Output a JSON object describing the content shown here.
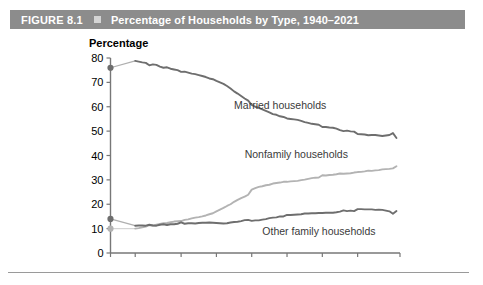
{
  "header": {
    "figure_label": "FIGURE 8.1",
    "bullet_icon": "square-bullet-icon",
    "title": "Percentage of Households by Type, 1940–2021",
    "bar_color": "#8c8c8c",
    "text_color": "#ffffff"
  },
  "chart_data": {
    "type": "line",
    "title": "Percentage of Households by Type, 1940–2021",
    "xlabel": "",
    "ylabel": "Percentage",
    "ylim": [
      0,
      80
    ],
    "xlim": [
      1940,
      2022
    ],
    "ytick_labels": [
      "0",
      "10",
      "20",
      "30",
      "40",
      "50",
      "60",
      "70",
      "80"
    ],
    "yticks": [
      0,
      10,
      20,
      30,
      40,
      50,
      60,
      70,
      80
    ],
    "xtick_labels": [
      "1940",
      "1947",
      "1960",
      "1970",
      "1980",
      "1990",
      "2000",
      "2010",
      "2022"
    ],
    "xticks": [
      1940,
      1947,
      1960,
      1970,
      1980,
      1990,
      2000,
      2010,
      2022
    ],
    "grid": false,
    "legend_position": "inline-annotations",
    "series": [
      {
        "name": "Married households",
        "color": "#6e6e6e",
        "label_x": 1975,
        "label_y": 59,
        "start_marker": {
          "x": 1940,
          "y": 76.0
        },
        "x": [
          1947,
          1948,
          1949,
          1950,
          1951,
          1952,
          1953,
          1954,
          1955,
          1956,
          1957,
          1958,
          1959,
          1960,
          1961,
          1962,
          1963,
          1964,
          1965,
          1966,
          1967,
          1968,
          1969,
          1970,
          1971,
          1972,
          1973,
          1974,
          1975,
          1976,
          1977,
          1978,
          1979,
          1980,
          1981,
          1982,
          1983,
          1984,
          1985,
          1986,
          1987,
          1988,
          1989,
          1990,
          1991,
          1992,
          1993,
          1994,
          1995,
          1996,
          1997,
          1998,
          1999,
          2000,
          2001,
          2002,
          2003,
          2004,
          2005,
          2006,
          2007,
          2008,
          2009,
          2010,
          2011,
          2012,
          2013,
          2014,
          2015,
          2016,
          2017,
          2018,
          2019,
          2020,
          2021
        ],
        "y": [
          78.8,
          78.5,
          78.2,
          78.0,
          77.0,
          77.4,
          77.2,
          76.5,
          76.0,
          76.2,
          75.6,
          75.3,
          75.0,
          74.3,
          74.4,
          74.0,
          73.6,
          73.4,
          73.0,
          72.6,
          72.2,
          71.6,
          71.3,
          70.6,
          70.0,
          69.4,
          68.5,
          67.5,
          66.3,
          65.4,
          64.4,
          63.4,
          62.5,
          60.8,
          60.0,
          59.5,
          58.9,
          58.3,
          57.7,
          57.0,
          56.7,
          56.1,
          55.8,
          55.2,
          55.0,
          54.8,
          54.6,
          54.2,
          53.7,
          53.4,
          53.0,
          52.8,
          52.6,
          51.7,
          51.7,
          51.5,
          51.4,
          51.0,
          50.4,
          50.0,
          50.2,
          49.9,
          49.8,
          48.8,
          48.7,
          48.6,
          48.3,
          48.4,
          48.4,
          48.2,
          48.0,
          48.2,
          48.4,
          49.2,
          47.2
        ]
      },
      {
        "name": "Nonfamily households",
        "color": "#b3b3b3",
        "label_x": 1978,
        "label_y": 39,
        "start_marker": {
          "x": 1940,
          "y": 10.0
        },
        "x": [
          1947,
          1948,
          1949,
          1950,
          1951,
          1952,
          1953,
          1954,
          1955,
          1956,
          1957,
          1958,
          1959,
          1960,
          1961,
          1962,
          1963,
          1964,
          1965,
          1966,
          1967,
          1968,
          1969,
          1970,
          1971,
          1972,
          1973,
          1974,
          1975,
          1976,
          1977,
          1978,
          1979,
          1980,
          1981,
          1982,
          1983,
          1984,
          1985,
          1986,
          1987,
          1988,
          1989,
          1990,
          1991,
          1992,
          1993,
          1994,
          1995,
          1996,
          1997,
          1998,
          1999,
          2000,
          2001,
          2002,
          2003,
          2004,
          2005,
          2006,
          2007,
          2008,
          2009,
          2010,
          2011,
          2012,
          2013,
          2014,
          2015,
          2016,
          2017,
          2018,
          2019,
          2020,
          2021
        ],
        "y": [
          10.0,
          10.2,
          10.5,
          10.8,
          11.4,
          11.3,
          11.6,
          11.9,
          12.2,
          12.3,
          12.6,
          12.9,
          13.0,
          13.1,
          13.6,
          13.8,
          14.2,
          14.5,
          14.7,
          15.0,
          15.4,
          15.9,
          16.3,
          17.1,
          17.8,
          18.5,
          19.3,
          20.0,
          21.0,
          21.8,
          22.5,
          23.1,
          23.9,
          26.0,
          26.6,
          27.1,
          27.4,
          27.8,
          28.0,
          28.5,
          28.7,
          28.9,
          29.2,
          29.2,
          29.4,
          29.5,
          29.6,
          29.9,
          30.1,
          30.4,
          30.7,
          30.9,
          31.0,
          31.9,
          31.8,
          32.0,
          32.1,
          32.3,
          32.6,
          32.5,
          32.6,
          32.7,
          33.0,
          33.2,
          33.3,
          33.5,
          33.8,
          33.7,
          33.9,
          34.0,
          34.3,
          34.4,
          34.5,
          34.7,
          35.6
        ]
      },
      {
        "name": "Other family households",
        "color": "#6e6e6e",
        "label_x": 1983,
        "label_y": 7.5,
        "start_marker": {
          "x": 1940,
          "y": 14.0
        },
        "x": [
          1947,
          1948,
          1949,
          1950,
          1951,
          1952,
          1953,
          1954,
          1955,
          1956,
          1957,
          1958,
          1959,
          1960,
          1961,
          1962,
          1963,
          1964,
          1965,
          1966,
          1967,
          1968,
          1969,
          1970,
          1971,
          1972,
          1973,
          1974,
          1975,
          1976,
          1977,
          1978,
          1979,
          1980,
          1981,
          1982,
          1983,
          1984,
          1985,
          1986,
          1987,
          1988,
          1989,
          1990,
          1991,
          1992,
          1993,
          1994,
          1995,
          1996,
          1997,
          1998,
          1999,
          2000,
          2001,
          2002,
          2003,
          2004,
          2005,
          2006,
          2007,
          2008,
          2009,
          2010,
          2011,
          2012,
          2013,
          2014,
          2015,
          2016,
          2017,
          2018,
          2019,
          2020,
          2021
        ],
        "y": [
          11.2,
          11.3,
          11.3,
          11.2,
          11.6,
          11.3,
          11.2,
          11.6,
          11.8,
          11.5,
          11.8,
          11.8,
          12.0,
          12.6,
          12.0,
          12.2,
          12.2,
          12.1,
          12.3,
          12.4,
          12.4,
          12.5,
          12.4,
          12.3,
          12.2,
          12.1,
          12.2,
          12.5,
          12.7,
          12.8,
          13.1,
          13.5,
          13.6,
          13.2,
          13.4,
          13.4,
          13.7,
          13.9,
          14.3,
          14.5,
          14.6,
          15.0,
          15.0,
          15.6,
          15.6,
          15.7,
          15.8,
          15.9,
          16.2,
          16.2,
          16.3,
          16.3,
          16.4,
          16.4,
          16.5,
          16.5,
          16.5,
          16.7,
          17.0,
          17.5,
          17.2,
          17.4,
          17.2,
          18.0,
          18.0,
          17.9,
          17.9,
          17.9,
          17.7,
          17.8,
          17.7,
          17.4,
          17.1,
          16.1,
          17.2
        ]
      }
    ]
  }
}
